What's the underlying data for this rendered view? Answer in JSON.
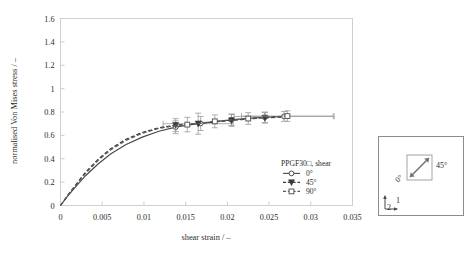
{
  "chart_data": {
    "type": "line",
    "title": "",
    "xlabel": "shear strain / –",
    "ylabel": "normalised Von Mises stress / –",
    "xlim": [
      0,
      0.035
    ],
    "ylim": [
      0,
      1.6
    ],
    "xticks": [
      0,
      0.005,
      0.01,
      0.015,
      0.02,
      0.025,
      0.03,
      0.035
    ],
    "xtick_labels": [
      "0",
      "0.005",
      "0.01",
      "0.015",
      "0.02",
      "0.025",
      "0.03",
      "0.035"
    ],
    "yticks": [
      0,
      0.2,
      0.4,
      0.6,
      0.8,
      1,
      1.2,
      1.4,
      1.6
    ],
    "ytick_labels": [
      "0",
      "0.2",
      "0.4",
      "0.6",
      "0.8",
      "1",
      "1.2",
      "1.4",
      "1.6"
    ],
    "grid": false,
    "legend_position": "lower-right-inside",
    "legend_title": "PPGF30□, shear",
    "series": [
      {
        "name": "0°",
        "marker": "open-circle",
        "linestyle": "solid",
        "color": "#4a4a4a",
        "x": [
          0,
          0.0008,
          0.0018,
          0.003,
          0.0045,
          0.006,
          0.0078,
          0.0098,
          0.0118,
          0.0138,
          0.0152,
          0.0168,
          0.0185,
          0.0205,
          0.0225,
          0.0245,
          0.0268
        ],
        "y": [
          0,
          0.075,
          0.16,
          0.255,
          0.355,
          0.44,
          0.52,
          0.585,
          0.635,
          0.67,
          0.688,
          0.702,
          0.718,
          0.733,
          0.745,
          0.755,
          0.762
        ],
        "error_points": [
          {
            "x": 0.0138,
            "y": 0.67,
            "yerr": 0.055,
            "xerr": 0
          },
          {
            "x": 0.0168,
            "y": 0.702,
            "yerr": 0.06,
            "xerr": 0
          },
          {
            "x": 0.0205,
            "y": 0.733,
            "yerr": 0.05,
            "xerr": 0
          },
          {
            "x": 0.0245,
            "y": 0.755,
            "yerr": 0.045,
            "xerr": 0
          },
          {
            "x": 0.0268,
            "y": 0.762,
            "yerr": 0.042,
            "xerr": 0.006
          }
        ]
      },
      {
        "name": "45°",
        "marker": "filled-triangle",
        "linestyle": "dashed",
        "color": "#3a3a3a",
        "x": [
          0,
          0.0008,
          0.0018,
          0.003,
          0.0045,
          0.006,
          0.0078,
          0.0098,
          0.0118,
          0.0138,
          0.0152,
          0.0165,
          0.0185,
          0.0205,
          0.0225,
          0.0245,
          0.0265
        ],
        "y": [
          0,
          0.08,
          0.175,
          0.285,
          0.395,
          0.485,
          0.565,
          0.625,
          0.665,
          0.688,
          0.695,
          0.7,
          0.715,
          0.728,
          0.74,
          0.75,
          0.757
        ],
        "error_points": [
          {
            "x": 0.0138,
            "y": 0.688,
            "yerr": 0.055,
            "xerr": 0
          },
          {
            "x": 0.0165,
            "y": 0.7,
            "yerr": 0.09,
            "xerr": 0.0042
          },
          {
            "x": 0.0205,
            "y": 0.728,
            "yerr": 0.05,
            "xerr": 0
          },
          {
            "x": 0.0245,
            "y": 0.75,
            "yerr": 0.045,
            "xerr": 0
          }
        ]
      },
      {
        "name": "90°",
        "marker": "open-square",
        "linestyle": "dashed",
        "color": "#5a5a5a",
        "x": [
          0,
          0.0008,
          0.0018,
          0.003,
          0.0045,
          0.006,
          0.0078,
          0.0098,
          0.0118,
          0.0138,
          0.0152,
          0.0168,
          0.0185,
          0.0205,
          0.0225,
          0.0248,
          0.0272
        ],
        "y": [
          0,
          0.078,
          0.17,
          0.275,
          0.385,
          0.475,
          0.555,
          0.618,
          0.66,
          0.683,
          0.692,
          0.705,
          0.72,
          0.732,
          0.744,
          0.756,
          0.765
        ],
        "error_points": [
          {
            "x": 0.0152,
            "y": 0.692,
            "yerr": 0.062,
            "xerr": 0
          },
          {
            "x": 0.0185,
            "y": 0.72,
            "yerr": 0.055,
            "xerr": 0
          },
          {
            "x": 0.0225,
            "y": 0.744,
            "yerr": 0.05,
            "xerr": 0
          },
          {
            "x": 0.0272,
            "y": 0.765,
            "yerr": 0.045,
            "xerr": 0.0055
          }
        ]
      }
    ],
    "annotations": []
  },
  "legend": {
    "title": "PPGF30□, shear",
    "entries": [
      {
        "label": "0°",
        "marker": "open-circle"
      },
      {
        "label": "45°",
        "marker": "filled-triangle"
      },
      {
        "label": "90°",
        "marker": "open-square"
      }
    ]
  },
  "inset": {
    "angle_label_45": "45°",
    "angle_label_0": "0°",
    "axis_label_1": "1",
    "axis_label_2": "2"
  },
  "colors": {
    "frame": "#cfcfcf",
    "text": "#2b2b2b",
    "series_0": "#4a4a4a",
    "series_45": "#3a3a3a",
    "series_90": "#5a5a5a",
    "errorbar": "#9a9a9a"
  }
}
